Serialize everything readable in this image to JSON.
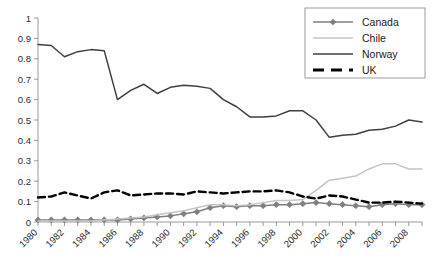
{
  "chart_data": {
    "type": "line",
    "title": "",
    "xlabel": "",
    "ylabel": "",
    "ylim": [
      0,
      1
    ],
    "xlim": [
      1980,
      2009
    ],
    "grid": false,
    "legend_position": "top-right",
    "ytick_labels": [
      "0",
      "0.1",
      "0.2",
      "0.3",
      "0.4",
      "0.5",
      "0.6",
      "0.7",
      "0.8",
      "0.9",
      "1"
    ],
    "ytick_values": [
      0,
      0.1,
      0.2,
      0.3,
      0.4,
      0.5,
      0.6,
      0.7,
      0.8,
      0.9,
      1
    ],
    "xtick_labels": [
      "1980",
      "1982",
      "1984",
      "1986",
      "1988",
      "1990",
      "1992",
      "1994",
      "1996",
      "1998",
      "2000",
      "2002",
      "2004",
      "2006",
      "2008"
    ],
    "x": [
      1980,
      1981,
      1982,
      1983,
      1984,
      1985,
      1986,
      1987,
      1988,
      1989,
      1990,
      1991,
      1992,
      1993,
      1994,
      1995,
      1996,
      1997,
      1998,
      1999,
      2000,
      2001,
      2002,
      2003,
      2004,
      2005,
      2006,
      2007,
      2008,
      2009
    ],
    "series": [
      {
        "name": "Canada",
        "color": "#7f7f7f",
        "marker": "diamond",
        "dash": "solid",
        "values": [
          0.01,
          0.01,
          0.01,
          0.01,
          0.01,
          0.01,
          0.01,
          0.015,
          0.02,
          0.025,
          0.03,
          0.04,
          0.05,
          0.07,
          0.08,
          0.075,
          0.08,
          0.08,
          0.085,
          0.085,
          0.09,
          0.095,
          0.09,
          0.085,
          0.08,
          0.075,
          0.085,
          0.09,
          0.085,
          0.085
        ]
      },
      {
        "name": "Chile",
        "color": "#c4c4c4",
        "marker": "none",
        "dash": "solid",
        "values": [
          0.005,
          0.005,
          0.005,
          0.005,
          0.005,
          0.01,
          0.015,
          0.02,
          0.025,
          0.035,
          0.045,
          0.055,
          0.07,
          0.085,
          0.085,
          0.08,
          0.085,
          0.095,
          0.105,
          0.105,
          0.11,
          0.155,
          0.205,
          0.215,
          0.225,
          0.26,
          0.285,
          0.285,
          0.26,
          0.26
        ]
      },
      {
        "name": "Norway",
        "color": "#3f3f3f",
        "marker": "none",
        "dash": "solid",
        "values": [
          0.87,
          0.865,
          0.81,
          0.835,
          0.845,
          0.84,
          0.6,
          0.645,
          0.675,
          0.63,
          0.66,
          0.67,
          0.665,
          0.655,
          0.6,
          0.565,
          0.515,
          0.515,
          0.52,
          0.545,
          0.545,
          0.5,
          0.415,
          0.425,
          0.43,
          0.45,
          0.455,
          0.47,
          0.5,
          0.49
        ]
      },
      {
        "name": "UK",
        "color": "#000000",
        "marker": "none",
        "dash": "dashed",
        "values": [
          0.12,
          0.125,
          0.145,
          0.13,
          0.115,
          0.145,
          0.155,
          0.13,
          0.135,
          0.14,
          0.14,
          0.135,
          0.15,
          0.145,
          0.14,
          0.145,
          0.15,
          0.15,
          0.155,
          0.145,
          0.125,
          0.115,
          0.13,
          0.125,
          0.11,
          0.095,
          0.095,
          0.1,
          0.095,
          0.09
        ]
      }
    ]
  },
  "legend": {
    "items": [
      {
        "label": "Canada"
      },
      {
        "label": "Chile"
      },
      {
        "label": "Norway"
      },
      {
        "label": "UK"
      }
    ]
  }
}
